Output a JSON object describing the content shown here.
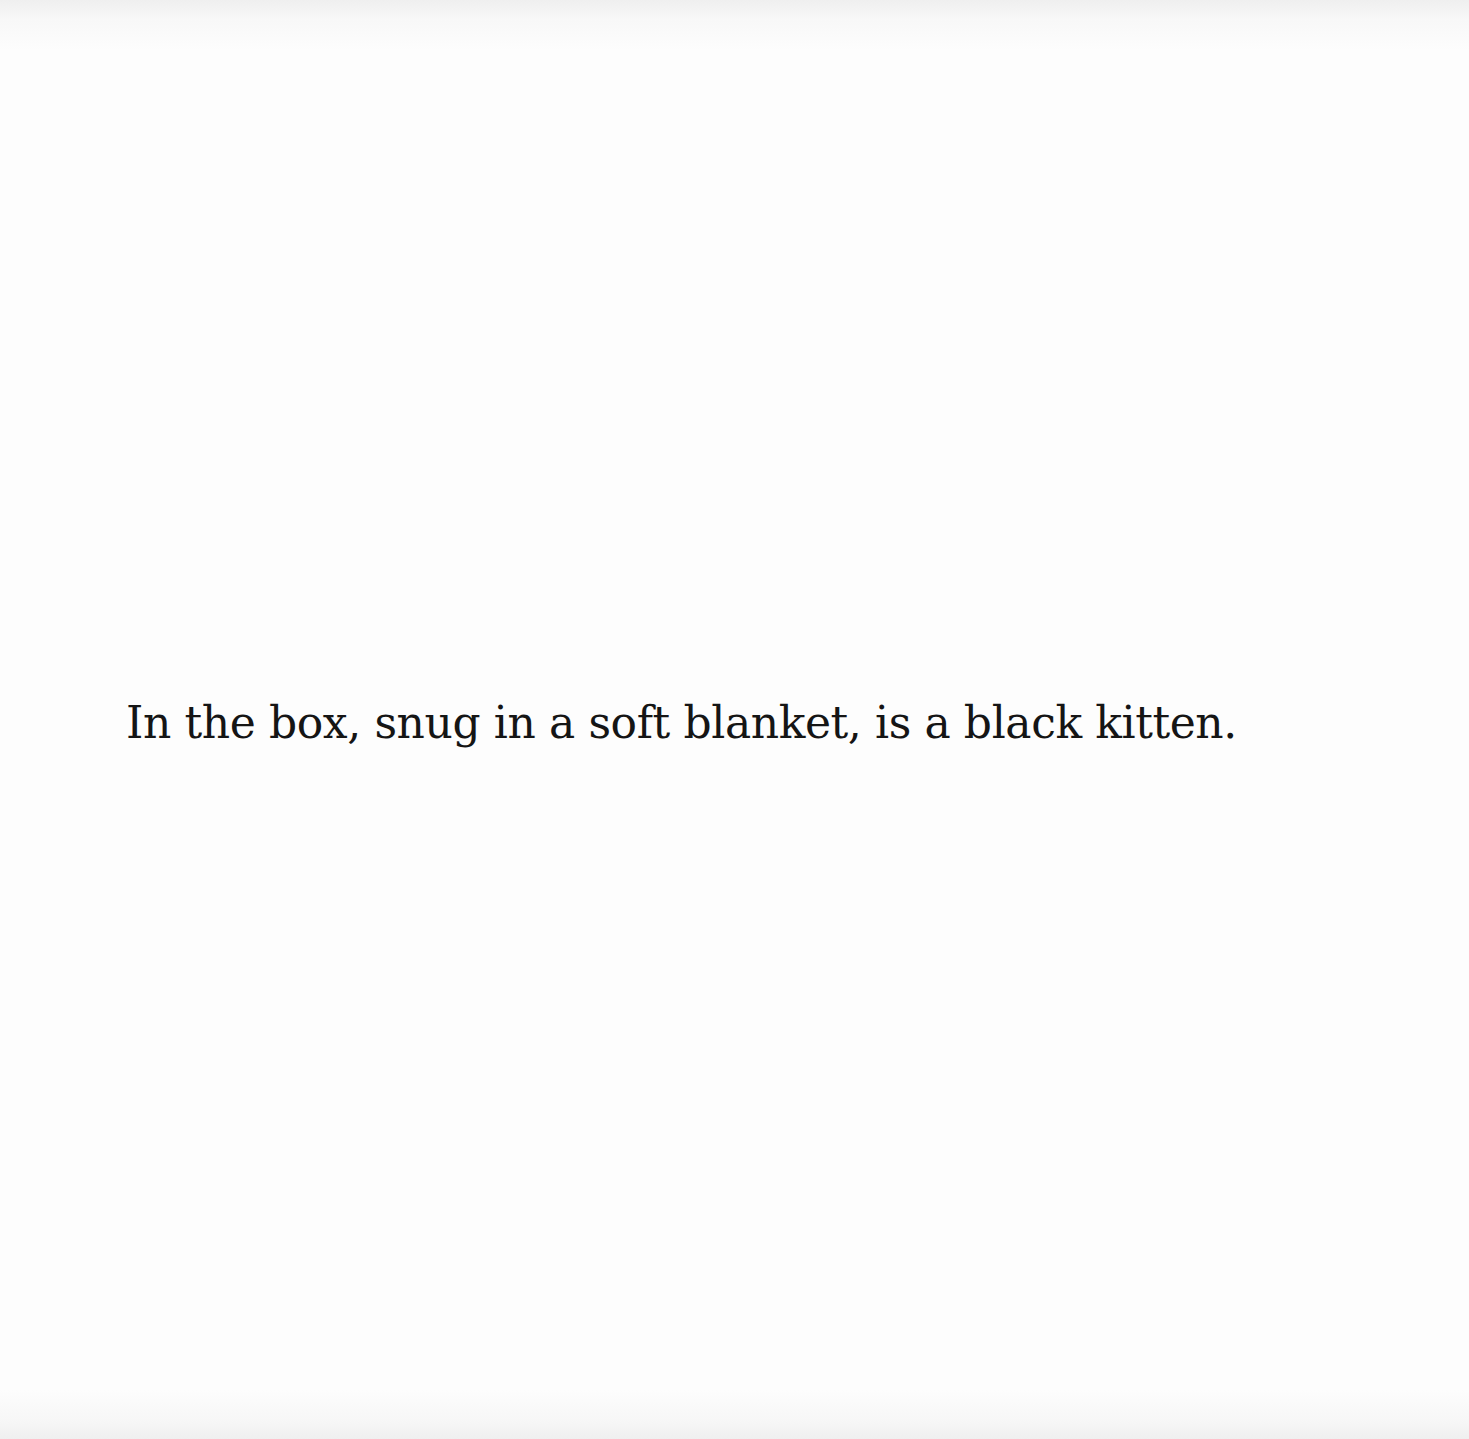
{
  "page": {
    "background_color": "#fdfdfd",
    "text_color": "#151515",
    "body_text": "In the box, snug in a soft blanket, is a black kitten."
  }
}
